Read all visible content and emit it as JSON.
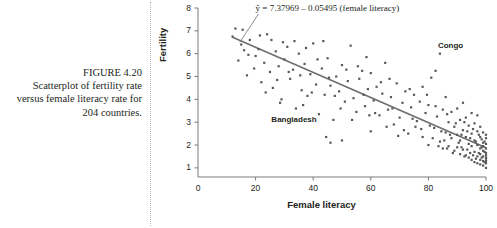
{
  "caption": {
    "figure_number": "FIGURE 4.20",
    "line1": "Scatterplot of fertility rate",
    "line2": "versus female literacy rate",
    "line3": "for 204 countries."
  },
  "colors": {
    "text": "#231f20",
    "point": "#585858",
    "line": "#6e6e6e",
    "axis": "#7a7a7a",
    "dotted_rule": "#b9b7bb"
  },
  "chart_data": {
    "type": "scatter",
    "title": "",
    "xlabel": "Female literacy",
    "ylabel": "Fertility",
    "xlim": [
      0,
      100
    ],
    "ylim": [
      0.6,
      8
    ],
    "xticks": [
      0,
      20,
      40,
      60,
      80,
      100
    ],
    "yticks": [
      1,
      2,
      3,
      4,
      5,
      6,
      7,
      8
    ],
    "grid": false,
    "legend": null,
    "n_points": 204,
    "regression": {
      "equation_text": "ŷ = 7.37969 – 0.05495 (female literacy)",
      "intercept": 7.37969,
      "slope": -0.05495,
      "x_start": 12,
      "x_end": 100
    },
    "annotations": [
      {
        "label": "Congo",
        "x": 84,
        "y": 6.0,
        "dx": -2,
        "dy": -13
      },
      {
        "label": "Bangladesh",
        "x": 47,
        "y": 3.1,
        "dx": -62,
        "dy": -5
      }
    ],
    "points": [
      [
        12,
        6.75
      ],
      [
        13,
        7.1
      ],
      [
        15,
        6.4
      ],
      [
        17,
        5.05
      ],
      [
        18,
        6.6
      ],
      [
        20,
        5.9
      ],
      [
        21,
        6.2
      ],
      [
        22,
        4.75
      ],
      [
        23,
        5.6
      ],
      [
        24,
        6.85
      ],
      [
        25,
        5.2
      ],
      [
        26,
        4.5
      ],
      [
        27,
        6.1
      ],
      [
        28,
        5.45
      ],
      [
        29,
        4.0
      ],
      [
        30,
        5.75
      ],
      [
        31,
        6.3
      ],
      [
        32,
        4.9
      ],
      [
        33,
        5.3
      ],
      [
        34,
        3.6
      ],
      [
        35,
        6.0
      ],
      [
        36,
        4.4
      ],
      [
        37,
        5.55
      ],
      [
        38,
        4.15
      ],
      [
        39,
        5.1
      ],
      [
        40,
        6.45
      ],
      [
        41,
        4.65
      ],
      [
        42,
        3.35
      ],
      [
        43,
        5.35
      ],
      [
        44,
        4.2
      ],
      [
        45,
        5.8
      ],
      [
        46,
        2.1
      ],
      [
        46,
        4.6
      ],
      [
        47,
        3.1
      ],
      [
        48,
        5.0
      ],
      [
        49,
        4.35
      ],
      [
        50,
        2.2
      ],
      [
        50,
        5.5
      ],
      [
        51,
        3.9
      ],
      [
        52,
        4.8
      ],
      [
        53,
        6.35
      ],
      [
        54,
        4.05
      ],
      [
        55,
        3.45
      ],
      [
        56,
        4.9
      ],
      [
        57,
        5.25
      ],
      [
        58,
        3.7
      ],
      [
        59,
        4.45
      ],
      [
        60,
        2.6
      ],
      [
        60,
        5.15
      ],
      [
        61,
        3.95
      ],
      [
        62,
        4.55
      ],
      [
        63,
        3.3
      ],
      [
        64,
        4.25
      ],
      [
        65,
        5.6
      ],
      [
        66,
        3.55
      ],
      [
        67,
        4.1
      ],
      [
        68,
        2.9
      ],
      [
        69,
        4.7
      ],
      [
        70,
        3.2
      ],
      [
        71,
        3.85
      ],
      [
        72,
        4.35
      ],
      [
        73,
        2.5
      ],
      [
        74,
        3.65
      ],
      [
        75,
        4.2
      ],
      [
        76,
        3.05
      ],
      [
        77,
        3.9
      ],
      [
        78,
        2.35
      ],
      [
        78,
        4.55
      ],
      [
        79,
        3.4
      ],
      [
        80,
        2.0
      ],
      [
        80,
        3.75
      ],
      [
        81,
        4.95
      ],
      [
        82,
        2.75
      ],
      [
        83,
        3.25
      ],
      [
        84,
        6.0
      ],
      [
        84,
        2.15
      ],
      [
        85,
        3.55
      ],
      [
        85,
        1.85
      ],
      [
        86,
        2.55
      ],
      [
        86,
        4.1
      ],
      [
        87,
        3.0
      ],
      [
        87,
        1.95
      ],
      [
        88,
        3.45
      ],
      [
        88,
        2.3
      ],
      [
        89,
        2.8
      ],
      [
        89,
        1.75
      ],
      [
        90,
        3.6
      ],
      [
        90,
        2.45
      ],
      [
        90,
        1.9
      ],
      [
        91,
        3.1
      ],
      [
        91,
        2.2
      ],
      [
        91,
        1.6
      ],
      [
        92,
        2.65
      ],
      [
        92,
        3.85
      ],
      [
        92,
        1.8
      ],
      [
        93,
        2.35
      ],
      [
        93,
        3.2
      ],
      [
        93,
        1.55
      ],
      [
        94,
        2.85
      ],
      [
        94,
        2.05
      ],
      [
        94,
        1.45
      ],
      [
        95,
        3.4
      ],
      [
        95,
        2.5
      ],
      [
        95,
        1.95
      ],
      [
        95,
        1.35
      ],
      [
        96,
        2.2
      ],
      [
        96,
        2.95
      ],
      [
        96,
        1.7
      ],
      [
        96,
        1.25
      ],
      [
        97,
        2.6
      ],
      [
        97,
        2.0
      ],
      [
        97,
        1.5
      ],
      [
        97,
        1.2
      ],
      [
        97,
        3.3
      ],
      [
        98,
        2.35
      ],
      [
        98,
        1.85
      ],
      [
        98,
        1.6
      ],
      [
        98,
        1.35
      ],
      [
        98,
        2.8
      ],
      [
        98,
        1.15
      ],
      [
        99,
        2.1
      ],
      [
        99,
        1.75
      ],
      [
        99,
        1.5
      ],
      [
        99,
        1.3
      ],
      [
        99,
        2.55
      ],
      [
        99,
        1.1
      ],
      [
        99,
        1.95
      ],
      [
        100,
        2.3
      ],
      [
        100,
        1.65
      ],
      [
        100,
        1.4
      ],
      [
        100,
        1.2
      ],
      [
        100,
        1.85
      ],
      [
        100,
        2.05
      ],
      [
        100,
        1.55
      ],
      [
        100,
        1.3
      ],
      [
        100,
        1.45
      ],
      [
        100,
        2.45
      ],
      [
        100,
        1.0
      ],
      [
        99.5,
        1.25
      ],
      [
        99.5,
        1.7
      ],
      [
        99.5,
        2.15
      ],
      [
        98.5,
        1.45
      ],
      [
        98.5,
        2.25
      ],
      [
        98.5,
        1.9
      ],
      [
        97.5,
        1.65
      ],
      [
        97.5,
        2.45
      ],
      [
        96.5,
        1.4
      ],
      [
        96.5,
        2.15
      ],
      [
        95.5,
        1.55
      ],
      [
        95.5,
        2.7
      ],
      [
        94.5,
        1.65
      ],
      [
        94.5,
        2.3
      ],
      [
        93.5,
        1.8
      ],
      [
        93.5,
        2.6
      ],
      [
        92.5,
        1.5
      ],
      [
        92.5,
        3.0
      ],
      [
        91.5,
        1.9
      ],
      [
        91.5,
        2.45
      ],
      [
        90.5,
        2.1
      ],
      [
        89.5,
        2.95
      ],
      [
        88.5,
        1.65
      ],
      [
        87.5,
        2.45
      ],
      [
        86.5,
        1.85
      ],
      [
        85.5,
        2.2
      ],
      [
        84.5,
        2.6
      ],
      [
        83.5,
        1.95
      ],
      [
        82.5,
        3.7
      ],
      [
        81.5,
        2.3
      ],
      [
        80.5,
        2.85
      ],
      [
        79.5,
        4.2
      ],
      [
        77.5,
        2.7
      ],
      [
        75.5,
        2.8
      ],
      [
        73.5,
        4.45
      ],
      [
        71.5,
        2.65
      ],
      [
        69.5,
        2.4
      ],
      [
        67.5,
        3.6
      ],
      [
        65.5,
        2.8
      ],
      [
        63.5,
        4.75
      ],
      [
        61.5,
        3.4
      ],
      [
        59.5,
        3.3
      ],
      [
        57.5,
        4.2
      ],
      [
        55.5,
        5.45
      ],
      [
        53.5,
        3.1
      ],
      [
        51.5,
        5.3
      ],
      [
        49.5,
        3.6
      ],
      [
        47.5,
        4.15
      ],
      [
        45.5,
        4.95
      ],
      [
        43.5,
        6.55
      ],
      [
        41.5,
        5.75
      ],
      [
        39.5,
        4.3
      ],
      [
        37.5,
        6.25
      ],
      [
        35.5,
        5.05
      ],
      [
        33.5,
        6.55
      ],
      [
        31.5,
        5.2
      ],
      [
        29.5,
        6.5
      ],
      [
        27.5,
        4.85
      ],
      [
        25.5,
        6.6
      ],
      [
        23.5,
        4.3
      ],
      [
        21.5,
        6.8
      ],
      [
        19.5,
        5.35
      ],
      [
        17.5,
        5.95
      ],
      [
        15.5,
        7.05
      ],
      [
        14,
        5.7
      ],
      [
        16,
        6.15
      ],
      [
        44.5,
        2.35
      ],
      [
        36.5,
        3.75
      ],
      [
        58.5,
        5.85
      ],
      [
        66.5,
        4.9
      ],
      [
        74.5,
        3.15
      ],
      [
        82.5,
        5.25
      ],
      [
        86.5,
        3.35
      ],
      [
        28.5,
        3.85
      ]
    ]
  }
}
